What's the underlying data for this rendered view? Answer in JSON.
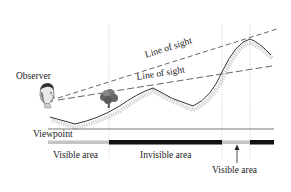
{
  "diagram": {
    "labels": {
      "observer": "Observer",
      "line_of_sight_1": "Line of sight",
      "line_of_sight_2": "Line of sight",
      "viewpoint": "Viewpoint",
      "visible_area_1": "Visible area",
      "invisible_area": "Invisible area",
      "visible_area_2": "Visible area"
    },
    "icons": {
      "observer": "face-icon",
      "tree": "tree-icon",
      "arrow": "arrow-up-icon"
    },
    "visibility_band": [
      {
        "state": "visible",
        "color": "#c4c4c4"
      },
      {
        "state": "invisible",
        "color": "#111111"
      },
      {
        "state": "visible",
        "color": "#c4c4c4"
      },
      {
        "state": "invisible",
        "color": "#111111"
      }
    ],
    "colors": {
      "terrain": "#333333",
      "terrain_shadow": "#bdbdbd",
      "sight_line": "#555555",
      "guide": "#b0b0b0",
      "text": "#222222"
    }
  }
}
